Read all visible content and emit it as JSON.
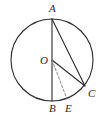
{
  "figure": {
    "kind": "circle-geometry-diagram",
    "background_color": "#ffffff",
    "stroke_color": "#2b2b2b",
    "dash_color": "#8a8a8a",
    "circle": {
      "cx": 52,
      "cy": 60,
      "r": 41
    },
    "points": [
      {
        "id": "A",
        "label": "A",
        "x": 52,
        "y": 19,
        "label_x": 49,
        "label_y": 3,
        "role": "top-of-circle"
      },
      {
        "id": "O",
        "label": "O",
        "x": 52,
        "y": 60,
        "label_x": 40,
        "label_y": 55,
        "role": "center"
      },
      {
        "id": "B",
        "label": "B",
        "x": 52,
        "y": 101,
        "label_x": 49,
        "label_y": 103,
        "role": "bottom-of-circle"
      },
      {
        "id": "E",
        "label": "E",
        "x": 67,
        "y": 99,
        "label_x": 65,
        "label_y": 103,
        "role": "on-circle-lower-right"
      },
      {
        "id": "C",
        "label": "C",
        "x": 85,
        "y": 86,
        "label_x": 88,
        "label_y": 88,
        "role": "on-circle-right"
      }
    ],
    "segments": [
      {
        "id": "AB",
        "from": "A",
        "to": "B",
        "style": "solid",
        "name": "diameter-ab"
      },
      {
        "id": "AC",
        "from": "A",
        "to": "C",
        "style": "solid",
        "name": "chord-ac"
      },
      {
        "id": "OC",
        "from": "O",
        "to": "C",
        "style": "solid",
        "name": "radius-oc"
      },
      {
        "id": "OE",
        "from": "O",
        "to": "E",
        "style": "dashed",
        "name": "segment-oe"
      }
    ]
  }
}
